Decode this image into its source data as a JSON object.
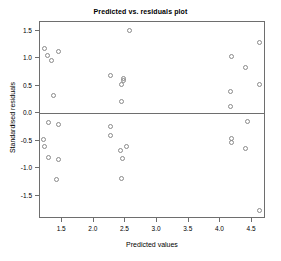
{
  "chart_data": {
    "type": "scatter",
    "title": "Predicted vs. residuals plot",
    "xlabel": "Predicted values",
    "ylabel": "Standardised residuals",
    "xlim": [
      1.15,
      4.72
    ],
    "ylim": [
      -1.92,
      1.66
    ],
    "xticks": [
      1.5,
      2.0,
      2.5,
      3.0,
      3.5,
      4.0,
      4.5
    ],
    "xtick_labels": [
      "1.5",
      "2.0",
      "2.5",
      "3.0",
      "3.5",
      "4.0",
      "4.5"
    ],
    "yticks": [
      1.5,
      1.0,
      0.5,
      0.0,
      -0.5,
      -1.0,
      -1.5
    ],
    "ytick_labels": [
      "1.5",
      "1.0",
      "0.5",
      "0.0",
      "-0.5",
      "-1.0",
      "-1.5"
    ],
    "grid": false,
    "legend": false,
    "marker": "open-circle",
    "marker_color": "#8a8a8a",
    "reference_lines": [
      {
        "orientation": "horizontal",
        "value": 0.0,
        "color": "#6e6e6e"
      }
    ],
    "points": [
      {
        "x": 1.22,
        "y": 1.17
      },
      {
        "x": 1.27,
        "y": 1.05
      },
      {
        "x": 1.33,
        "y": 0.96
      },
      {
        "x": 1.45,
        "y": 1.13
      },
      {
        "x": 1.36,
        "y": 0.33
      },
      {
        "x": 2.26,
        "y": 0.68
      },
      {
        "x": 2.47,
        "y": 0.64
      },
      {
        "x": 2.47,
        "y": 0.6
      },
      {
        "x": 2.44,
        "y": 0.52
      },
      {
        "x": 2.44,
        "y": 0.22
      },
      {
        "x": 2.56,
        "y": 1.51
      },
      {
        "x": 4.17,
        "y": 1.03
      },
      {
        "x": 4.4,
        "y": 0.83
      },
      {
        "x": 4.61,
        "y": 1.28
      },
      {
        "x": 4.61,
        "y": 0.53
      },
      {
        "x": 4.16,
        "y": 0.39
      },
      {
        "x": 4.16,
        "y": 0.12
      },
      {
        "x": 1.28,
        "y": -0.17
      },
      {
        "x": 1.45,
        "y": -0.21
      },
      {
        "x": 1.2,
        "y": -0.48
      },
      {
        "x": 1.22,
        "y": -0.6
      },
      {
        "x": 1.28,
        "y": -0.8
      },
      {
        "x": 1.45,
        "y": -0.84
      },
      {
        "x": 1.41,
        "y": -1.21
      },
      {
        "x": 2.27,
        "y": -0.24
      },
      {
        "x": 2.27,
        "y": -0.4
      },
      {
        "x": 2.42,
        "y": -0.67
      },
      {
        "x": 2.52,
        "y": -0.61
      },
      {
        "x": 2.46,
        "y": -0.82
      },
      {
        "x": 2.43,
        "y": -1.18
      },
      {
        "x": 4.42,
        "y": -0.14
      },
      {
        "x": 4.17,
        "y": -0.46
      },
      {
        "x": 4.17,
        "y": -0.53
      },
      {
        "x": 4.4,
        "y": -0.64
      },
      {
        "x": 4.62,
        "y": -1.77
      }
    ]
  }
}
